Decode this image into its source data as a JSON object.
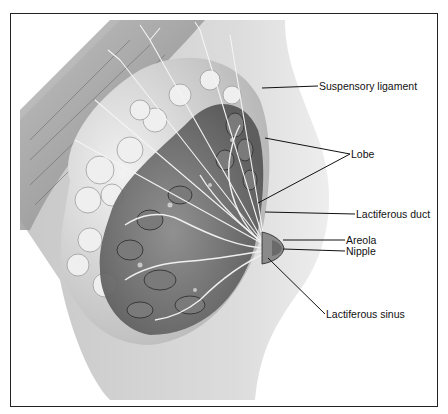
{
  "figure": {
    "type": "anatomical-illustration",
    "colors": {
      "frame": "#222222",
      "background": "#ffffff",
      "skin": "#d6d6d6",
      "muscle": "#9a9a9a",
      "fat": "#e4e4e4",
      "gland": "#6e6e6e",
      "line": "#111111"
    }
  },
  "labels": [
    {
      "id": "suspensory-ligament",
      "text": "Suspensory ligament"
    },
    {
      "id": "lobe",
      "text": "Lobe"
    },
    {
      "id": "lactiferous-duct",
      "text": "Lactiferous duct"
    },
    {
      "id": "areola",
      "text": "Areola"
    },
    {
      "id": "nipple",
      "text": "Nipple"
    },
    {
      "id": "lactiferous-sinus",
      "text": "Lactiferous sinus"
    }
  ]
}
